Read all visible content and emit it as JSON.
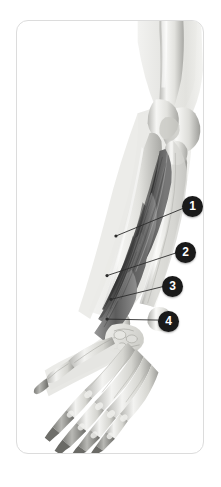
{
  "figure": {
    "kind": "anatomical-illustration",
    "view": "anterior forearm and hand",
    "style": "grayscale medical illustration",
    "colors": {
      "page_background": "#ffffff",
      "card_background": "#ffffff",
      "card_border": "#dcdcdc",
      "marker_fill": "#1a1a1a",
      "marker_text": "#ffffff",
      "leader_line": "#2b2b2b",
      "bone_light": "#f4f4f2",
      "bone_mid": "#d8d8d4",
      "bone_shadow": "#a9a9a5",
      "ghost_limb": "#e8e8e6",
      "muscle_dark": "#3a3a3a",
      "muscle_mid": "#6e6e6e",
      "muscle_light": "#9a9a9a"
    }
  },
  "callouts": [
    {
      "id": "1",
      "label": "1",
      "marker_x": 175,
      "marker_y": 185,
      "tip_x": 100,
      "tip_y": 216
    },
    {
      "id": "2",
      "label": "2",
      "marker_x": 168,
      "marker_y": 231,
      "tip_x": 91,
      "tip_y": 256
    },
    {
      "id": "3",
      "label": "3",
      "marker_x": 155,
      "marker_y": 265,
      "tip_x": 95,
      "tip_y": 280
    },
    {
      "id": "4",
      "label": "4",
      "marker_x": 151,
      "marker_y": 300,
      "tip_x": 91,
      "tip_y": 300
    }
  ]
}
